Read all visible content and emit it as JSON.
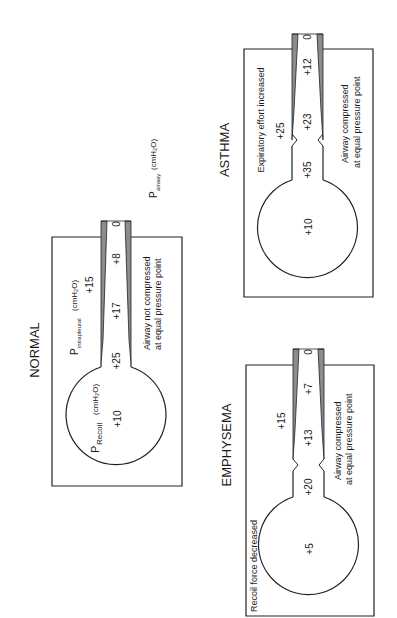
{
  "colors": {
    "line": "#222222",
    "wall": "#8c8c8c",
    "background": "#ffffff"
  },
  "panels": {
    "normal": {
      "title": "NORMAL",
      "recoil_label": "P",
      "recoil_sub": "Recoil",
      "recoil_unit": "(cmH₂O)",
      "intrapleural_label": "P",
      "intrapleural_sub": "intrapleural",
      "intrapleural_unit": "(cmH₂O)",
      "airway_label": "P",
      "airway_sub": "airway",
      "airway_unit": "(cmH₂O)",
      "alveolar": "+10",
      "intrapleural": "+15",
      "airway_values": [
        "+25",
        "+17",
        "+8"
      ],
      "mouth": "0",
      "note_line1": "Airway not compressed",
      "note_line2": "at equal pressure point"
    },
    "asthma": {
      "title": "ASTHMA",
      "caption": "Expiratory effort increased",
      "alveolar": "+10",
      "intrapleural": "+25",
      "airway_values": [
        "+35",
        "+23",
        "+12"
      ],
      "mouth": "0",
      "note_line1": "Airway compressed",
      "note_line2": "at equal pressure point"
    },
    "emphysema": {
      "title": "EMPHYSEMA",
      "caption": "Recoil force decreased",
      "alveolar": "+5",
      "intrapleural": "+15",
      "airway_values": [
        "+20",
        "+13",
        "+7"
      ],
      "mouth": "0",
      "note_line1": "Airway compressed",
      "note_line2": "at equal pressure point"
    }
  }
}
